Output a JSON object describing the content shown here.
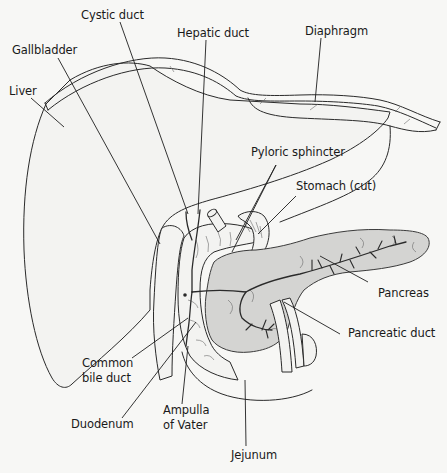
{
  "diagram": {
    "colors": {
      "background": "#f7f7f5",
      "line": "#2a2a2a",
      "pancreas_fill": "#d4d4d2"
    },
    "labels": {
      "cystic_duct": "Cystic duct",
      "hepatic_duct": "Hepatic duct",
      "diaphragm": "Diaphragm",
      "gallbladder": "Gallbladder",
      "liver": "Liver",
      "pyloric_sphincter": "Pyloric sphincter",
      "stomach_cut": "Stomach (cut)",
      "pancreas": "Pancreas",
      "pancreatic_duct": "Pancreatic duct",
      "common_bile_duct_line1": "Common",
      "common_bile_duct_line2": "bile duct",
      "duodenum": "Duodenum",
      "ampulla_line1": "Ampulla",
      "ampulla_line2": "of Vater",
      "jejunum": "Jejunum"
    }
  }
}
